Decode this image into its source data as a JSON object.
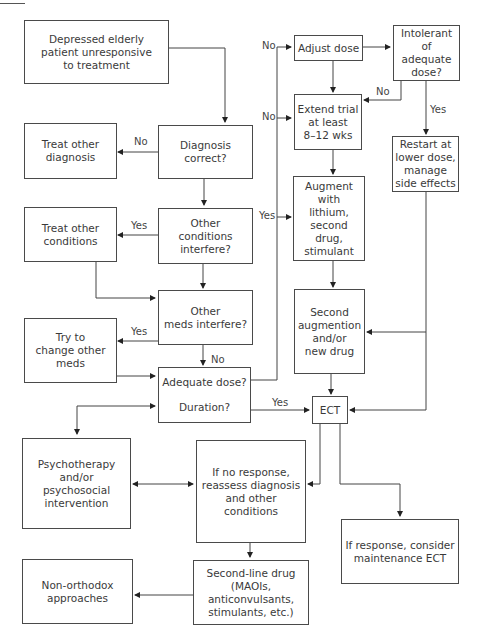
{
  "diagram": {
    "type": "flowchart",
    "nodes": {
      "start": "Depressed elderly\npatient unresponsive\nto treatment",
      "treat_other_diagnosis": "Treat other\ndiagnosis",
      "diagnosis_correct": "Diagnosis\ncorrect?",
      "treat_other_conditions": "Treat other\nconditions",
      "other_conditions_interfere": "Other\nconditions\ninterfere?",
      "other_meds_interfere": "Other\nmeds interfere?",
      "try_change_meds": "Try to\nchange other\nmeds",
      "adequate_dose": "Adequate dose?",
      "duration": "Duration?",
      "psychotherapy": "Psychotherapy\nand/or\npsychosocial\nintervention",
      "no_response_reassess": "If no response,\nreassess diagnosis\nand other conditions",
      "non_orthodox": "Non-orthodox\napproaches",
      "second_line_drug": "Second-line drug (MAOIs,\nanticonvulsants,\nstimulants, etc.)",
      "adjust_dose": "Adjust dose",
      "intolerant": "Intolerant of\nadequate\ndose?",
      "extend_trial": "Extend trial\nat least\n8–12 wks",
      "restart_lower": "Restart at\nlower dose,\nmanage\nside effects",
      "augment": "Augment with\nlithium, second\ndrug, stimulant",
      "second_augmention": "Second\naugmention\nand/or\nnew drug",
      "ect": "ECT",
      "response_maintenance": "If response, consider\nmaintenance ECT"
    },
    "edge_labels": {
      "diag_no": "No",
      "cond_yes": "Yes",
      "meds_yes": "Yes",
      "meds_no": "No",
      "adjust_no": "No",
      "extend_no": "No",
      "augment_yes": "Yes",
      "intolerant_no": "No",
      "intolerant_yes": "Yes",
      "duration_yes": "Yes"
    }
  }
}
